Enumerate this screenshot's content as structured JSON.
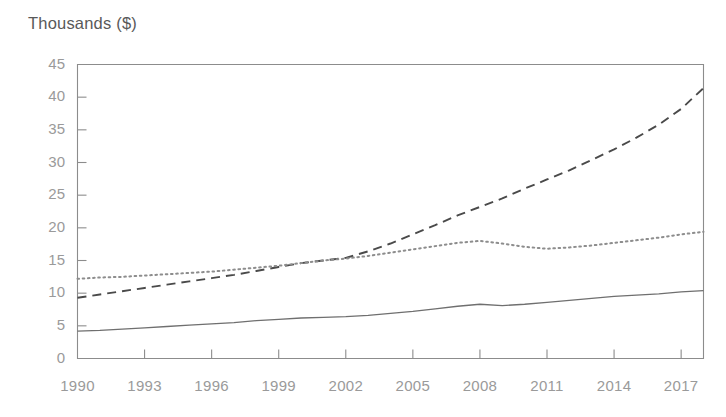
{
  "chart_data": {
    "type": "line",
    "title": "Thousands ($)",
    "xlabel": "",
    "ylabel": "Thousands ($)",
    "ylim": [
      0,
      45
    ],
    "xlim": [
      1990,
      2018
    ],
    "grid": false,
    "legend": "none",
    "ytick_labels": [
      "45",
      "40",
      "35",
      "30",
      "25",
      "20",
      "15",
      "10",
      "5",
      "0"
    ],
    "ytick_values": [
      45,
      40,
      35,
      30,
      25,
      20,
      15,
      10,
      5,
      0
    ],
    "xtick_labels": [
      "1990",
      "1993",
      "1996",
      "1999",
      "2002",
      "2005",
      "2008",
      "2011",
      "2014",
      "2017"
    ],
    "xtick_values": [
      1990,
      1993,
      1996,
      1999,
      2002,
      2005,
      2008,
      2011,
      2014,
      2017
    ],
    "x": [
      1990,
      1991,
      1992,
      1993,
      1994,
      1995,
      1996,
      1997,
      1998,
      1999,
      2000,
      2001,
      2002,
      2003,
      2004,
      2005,
      2006,
      2007,
      2008,
      2009,
      2010,
      2011,
      2012,
      2013,
      2014,
      2015,
      2016,
      2017,
      2018
    ],
    "series": [
      {
        "name": "dashed-series",
        "style": "dashed",
        "color": "#4a4a4a",
        "values": [
          9.3,
          9.8,
          10.3,
          10.8,
          11.3,
          11.8,
          12.3,
          12.8,
          13.4,
          14.0,
          14.6,
          15.0,
          15.4,
          16.4,
          17.6,
          19.0,
          20.4,
          21.9,
          23.2,
          24.5,
          26.0,
          27.4,
          28.8,
          30.4,
          32.0,
          33.8,
          35.8,
          38.2,
          41.4
        ]
      },
      {
        "name": "dotted-series",
        "style": "dotted",
        "color": "#8d8d8d",
        "values": [
          12.2,
          12.4,
          12.5,
          12.7,
          12.9,
          13.1,
          13.3,
          13.6,
          13.9,
          14.2,
          14.6,
          15.0,
          15.3,
          15.7,
          16.2,
          16.7,
          17.2,
          17.7,
          18.0,
          17.6,
          17.1,
          16.8,
          17.0,
          17.3,
          17.7,
          18.1,
          18.5,
          19.0,
          19.4
        ]
      },
      {
        "name": "solid-series",
        "style": "solid",
        "color": "#6f6f6f",
        "values": [
          4.2,
          4.3,
          4.5,
          4.7,
          4.9,
          5.1,
          5.3,
          5.5,
          5.8,
          6.0,
          6.2,
          6.3,
          6.4,
          6.6,
          6.9,
          7.2,
          7.6,
          8.0,
          8.3,
          8.1,
          8.3,
          8.6,
          8.9,
          9.2,
          9.5,
          9.7,
          9.9,
          10.2,
          10.4
        ]
      }
    ]
  },
  "axes": {
    "frame_color": "#8c8c8c",
    "tick_color": "#8c8c8c",
    "background": "#ffffff"
  }
}
